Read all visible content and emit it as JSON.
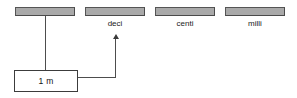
{
  "diagram": {
    "colors": {
      "bar_fill": "#a9a9a9",
      "bar_border": "#4a4a4a",
      "line": "#4d4d4d",
      "box_border": "#3c3c3c",
      "text": "#1a1a1a",
      "background": "#ffffff"
    },
    "bars": [
      {
        "id": "base",
        "label": "",
        "x": 15,
        "y": 7,
        "width": 60,
        "height": 9
      },
      {
        "id": "deci",
        "label": "deci",
        "x": 85,
        "y": 7,
        "width": 60,
        "height": 9
      },
      {
        "id": "centi",
        "label": "centi",
        "x": 155,
        "y": 7,
        "width": 60,
        "height": 9
      },
      {
        "id": "milli",
        "label": "milli",
        "x": 225,
        "y": 7,
        "width": 60,
        "height": 9
      }
    ],
    "value_box": {
      "text": "1 m",
      "x": 14,
      "y": 70,
      "width": 64,
      "height": 22
    },
    "connector": {
      "from": "base-bar",
      "to": "deci-bar",
      "arrow_direction": "up"
    }
  }
}
